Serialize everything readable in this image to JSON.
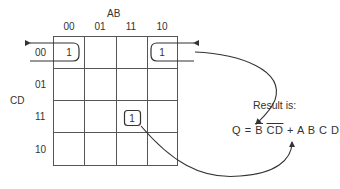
{
  "diagram": {
    "type": "karnaugh-map",
    "column_variable": "AB",
    "row_variable": "CD",
    "column_labels": [
      "00",
      "01",
      "11",
      "10"
    ],
    "row_labels": [
      "00",
      "01",
      "11",
      "10"
    ],
    "cells": [
      [
        "1",
        "",
        "",
        "1"
      ],
      [
        "",
        "",
        "",
        ""
      ],
      [
        "",
        "",
        "1",
        ""
      ],
      [
        "",
        "",
        "",
        ""
      ]
    ],
    "groups": [
      {
        "name": "wraparound-group",
        "cells": [
          [
            0,
            0
          ],
          [
            0,
            3
          ]
        ],
        "term": "B̄C̄D̄"
      },
      {
        "name": "single-cell-group",
        "cells": [
          [
            2,
            2
          ]
        ],
        "term": "ABCD"
      }
    ],
    "result_label": "Result is:",
    "equation": {
      "lhs": "Q",
      "equals": "=",
      "term1": [
        "B",
        "C",
        "D"
      ],
      "plus": "+",
      "term2": [
        "A",
        "B",
        "C",
        "D"
      ]
    },
    "colors": {
      "line": "#444444",
      "text": "#333333",
      "background": "#ffffff"
    }
  }
}
